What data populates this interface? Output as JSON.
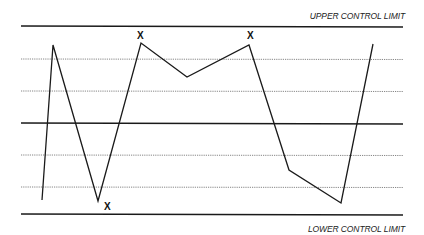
{
  "chart_data": {
    "type": "line",
    "title": "",
    "xlabel": "",
    "ylabel": "",
    "grid": false,
    "reference_lines": [
      {
        "name": "Upper Control Limit",
        "label": "UPPER CONTROL LIMIT",
        "y_px": 26,
        "style": "solid"
      },
      {
        "name": "Upper zone 1",
        "y_px": 59,
        "style": "dotted"
      },
      {
        "name": "Upper zone 2",
        "y_px": 91,
        "style": "dotted"
      },
      {
        "name": "Center line",
        "y_px": 123,
        "style": "solid"
      },
      {
        "name": "Lower zone 2",
        "y_px": 155,
        "style": "dotted"
      },
      {
        "name": "Lower zone 1",
        "y_px": 187,
        "style": "dotted"
      },
      {
        "name": "Lower Control Limit",
        "label": "LOWER CONTROL LIMIT",
        "y_px": 214,
        "style": "solid"
      }
    ],
    "series": [
      {
        "name": "process",
        "points_px": [
          [
            42,
            200
          ],
          [
            53,
            45
          ],
          [
            98,
            201
          ],
          [
            141,
            43
          ],
          [
            187,
            77
          ],
          [
            249,
            45
          ],
          [
            289,
            170
          ],
          [
            341,
            203
          ],
          [
            373,
            44
          ]
        ]
      }
    ],
    "annotations": [
      {
        "text": "X",
        "x_px": 140,
        "y_px": 37
      },
      {
        "text": "X",
        "x_px": 251,
        "y_px": 37
      },
      {
        "text": "X",
        "x_px": 108,
        "y_px": 208
      }
    ]
  },
  "labels": {
    "ucl": "UPPER CONTROL LIMIT",
    "lcl": "LOWER CONTROL LIMIT"
  },
  "markers": [
    "X",
    "X",
    "X"
  ]
}
